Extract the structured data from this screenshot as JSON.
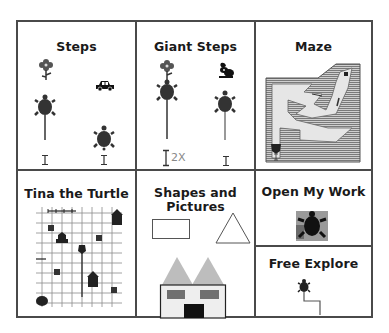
{
  "menu": {
    "tiles": [
      {
        "id": "steps",
        "label": "Steps"
      },
      {
        "id": "giant-steps",
        "label": "Giant Steps",
        "multiplier_label": "2X"
      },
      {
        "id": "maze",
        "label": "Maze"
      },
      {
        "id": "tina-the-turtle",
        "label": "Tina the Turtle"
      },
      {
        "id": "shapes-and-pictures",
        "label_line1": "Shapes and",
        "label_line2": "Pictures"
      },
      {
        "id": "open-my-work",
        "label": "Open My Work"
      },
      {
        "id": "free-explore",
        "label": "Free Explore"
      }
    ]
  },
  "colors": {
    "border": "#4a4a4a",
    "turtle": "#333333",
    "roof": "#bdbdbd",
    "house_wall": "#eeeeee",
    "window": "#707070",
    "door": "#111111",
    "maze_hatch": "#8a8a8a",
    "maze_path": "#e6e6e6"
  }
}
